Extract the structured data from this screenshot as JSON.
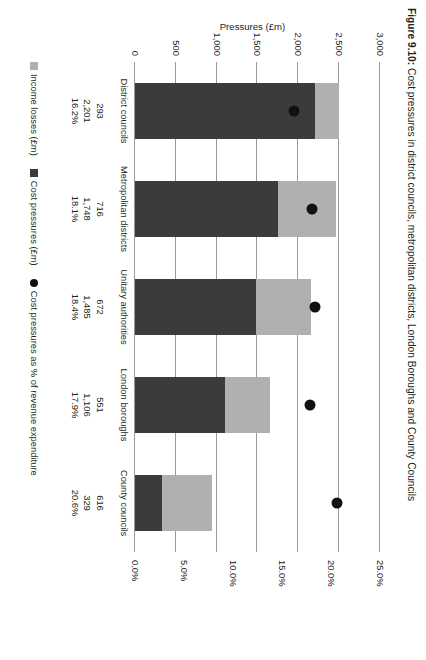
{
  "figure": {
    "number": "Figure 9.10:",
    "title": "Cost pressures in district councils, metropolitan districts, London Boroughs and County Councils"
  },
  "axes": {
    "left_title": "Pressures (£m)",
    "right_title": "Pressures as % of revenue expenditure",
    "left_ticks": [
      "3,000",
      "2,500",
      "2,000",
      "1,500",
      "1,000",
      "500",
      "0"
    ],
    "right_ticks": [
      "25.0%",
      "20.0%",
      "15.0%",
      "10.0%",
      "5.0%",
      "0.0%"
    ]
  },
  "legend": {
    "income_losses": "Income losses (£m)",
    "cost_pressures": "Cost pressures (£m)",
    "cost_pressures_pct": "Cost pressures as % of revenue expenditure"
  },
  "colors": {
    "income_losses": "#b0b0b0",
    "cost_pressures": "#3b3b3b",
    "marker": "#111111",
    "gridline": "#9a9a9a"
  },
  "categories": [
    {
      "name": "District councils",
      "income_losses": "293",
      "cost_pressures": "2,201",
      "pct": "16.2%"
    },
    {
      "name": "Metropolitan districts",
      "income_losses": "716",
      "cost_pressures": "1,748",
      "pct": "18.1%"
    },
    {
      "name": "Unitary authorities",
      "income_losses": "672",
      "cost_pressures": "1,485",
      "pct": "18.4%"
    },
    {
      "name": "London boroughs",
      "income_losses": "551",
      "cost_pressures": "1,106",
      "pct": "17.9%"
    },
    {
      "name": "County councils",
      "income_losses": "616",
      "cost_pressures": "329",
      "pct": "20.6%"
    }
  ],
  "chart_data": {
    "type": "bar",
    "title": "Figure 9.10: Cost pressures in district councils, metropolitan districts, London Boroughs and County Councils",
    "orientation": "vertical-stacked-with-overlay-scatter",
    "categories": [
      "District councils",
      "Metropolitan districts",
      "Unitary authorities",
      "London boroughs",
      "County councils"
    ],
    "series": [
      {
        "name": "Cost pressures (£m)",
        "axis": "left",
        "values": [
          2201,
          1748,
          1485,
          1106,
          329
        ]
      },
      {
        "name": "Income losses (£m)",
        "axis": "left",
        "values": [
          293,
          716,
          672,
          551,
          616
        ]
      },
      {
        "name": "Cost pressures as % of revenue expenditure",
        "axis": "right",
        "type": "scatter",
        "values": [
          16.2,
          18.1,
          18.4,
          17.9,
          20.6
        ]
      }
    ],
    "xlabel": "",
    "ylabel": "Pressures (£m)",
    "y2label": "Pressures as % of revenue expenditure",
    "ylim": [
      0,
      3000
    ],
    "yticks": [
      0,
      500,
      1000,
      1500,
      2000,
      2500,
      3000
    ],
    "y2lim": [
      0,
      25
    ],
    "y2ticks": [
      0,
      5,
      10,
      15,
      20,
      25
    ],
    "grid": true,
    "legend_position": "bottom"
  }
}
